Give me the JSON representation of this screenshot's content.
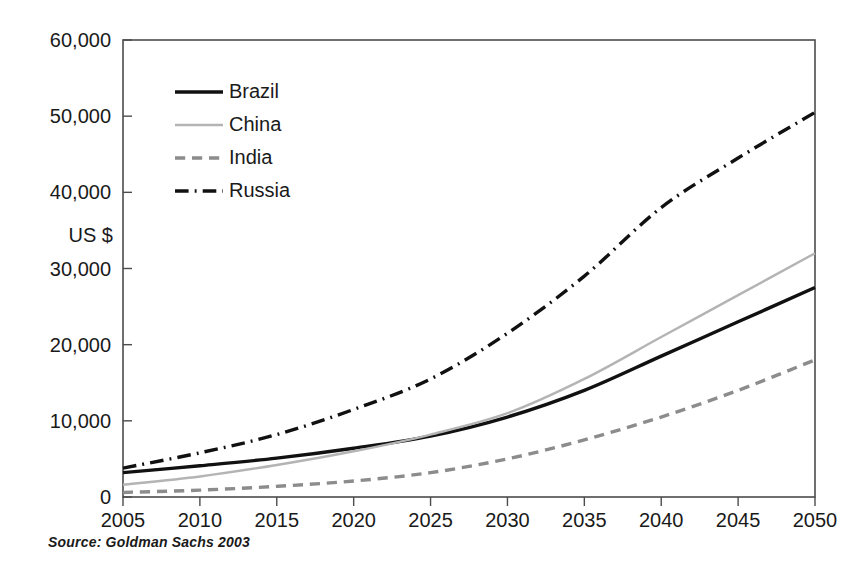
{
  "chart_data": {
    "type": "line",
    "title": "",
    "subtitle": "",
    "xlabel": "",
    "ylabel": "US $",
    "x": [
      2005,
      2010,
      2015,
      2020,
      2025,
      2030,
      2035,
      2040,
      2045,
      2050
    ],
    "x_tick_labels": [
      "2005",
      "2010",
      "2015",
      "2020",
      "2025",
      "2030",
      "2035",
      "2040",
      "2045",
      "2050"
    ],
    "y_tick_labels": [
      "0",
      "10,000",
      "20,000",
      "30,000",
      "40,000",
      "50,000",
      "60,000"
    ],
    "y_ticks": [
      0,
      10000,
      20000,
      30000,
      40000,
      50000,
      60000
    ],
    "xlim": [
      2005,
      2050
    ],
    "ylim": [
      0,
      60000
    ],
    "grid": false,
    "legend_position": "upper-left-inside",
    "series": [
      {
        "name": "Brazil",
        "color": "#111111",
        "style": "solid",
        "width": 3.4,
        "values": [
          3200,
          4100,
          5100,
          6400,
          8000,
          10500,
          14000,
          18500,
          23000,
          27500
        ]
      },
      {
        "name": "China",
        "color": "#b4b4b4",
        "style": "solid",
        "width": 2.4,
        "values": [
          1600,
          2700,
          4200,
          6000,
          8200,
          11000,
          15500,
          21000,
          26500,
          32000
        ]
      },
      {
        "name": "India",
        "color": "#8c8c8c",
        "style": "dashed",
        "width": 3.4,
        "values": [
          600,
          900,
          1400,
          2100,
          3200,
          5000,
          7500,
          10500,
          14000,
          18000
        ]
      },
      {
        "name": "Russia",
        "color": "#111111",
        "style": "dashdot",
        "width": 3.4,
        "values": [
          3800,
          5800,
          8200,
          11500,
          15500,
          21500,
          29000,
          38000,
          44500,
          50500
        ]
      }
    ]
  },
  "axis": {
    "unit_label": "US $"
  },
  "footer": {
    "source": "Source:  Goldman Sachs 2003"
  },
  "colors": {
    "frame": "#4c4c4c",
    "text": "#1a1a1a",
    "background": "#ffffff"
  }
}
